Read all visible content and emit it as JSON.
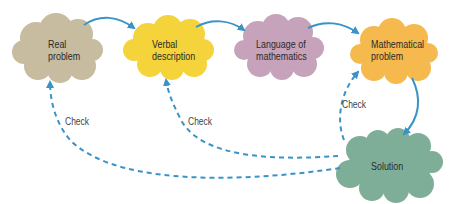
{
  "nodes": [
    {
      "id": "real",
      "line1": "Real",
      "line2": "problem",
      "color": "#c7bba0"
    },
    {
      "id": "verbal",
      "line1": "Verbal",
      "line2": "description",
      "color": "#f5d33a"
    },
    {
      "id": "language",
      "line1": "Language of",
      "line2": "mathematics",
      "color": "#c6a3ba"
    },
    {
      "id": "math",
      "line1": "Mathematical",
      "line2": "problem",
      "color": "#f5b94e"
    },
    {
      "id": "solution",
      "line1": "Solution",
      "color": "#7fae98"
    }
  ],
  "edges": [
    {
      "from": "Real problem",
      "to": "Verbal description",
      "style": "solid"
    },
    {
      "from": "Verbal description",
      "to": "Language of mathematics",
      "style": "solid"
    },
    {
      "from": "Language of mathematics",
      "to": "Mathematical problem",
      "style": "solid"
    },
    {
      "from": "Mathematical problem",
      "to": "Solution",
      "style": "solid"
    },
    {
      "from": "Solution",
      "to": "Real problem",
      "style": "dashed",
      "label": "Check"
    },
    {
      "from": "Solution",
      "to": "Verbal description",
      "style": "dashed",
      "label": "Check"
    },
    {
      "from": "Solution",
      "to": "Mathematical problem",
      "style": "dashed",
      "label": "Check"
    }
  ],
  "check_labels": [
    "Check",
    "Check",
    "Check"
  ],
  "colors": {
    "arrow": "#3a93c8"
  }
}
